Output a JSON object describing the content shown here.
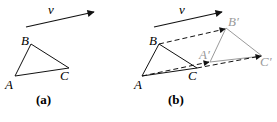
{
  "panels": [
    {
      "id": "a",
      "caption": "(a)",
      "vector_label": "v",
      "points": {
        "A": "A",
        "B": "B",
        "C": "C"
      }
    },
    {
      "id": "b",
      "caption": "(b)",
      "vector_label": "v",
      "points": {
        "A": "A",
        "B": "B",
        "C": "C",
        "A_prime": "A′",
        "B_prime": "B′",
        "C_prime": "C′"
      }
    }
  ],
  "colors": {
    "primary": "#111111",
    "translated": "#9a9a9a"
  }
}
